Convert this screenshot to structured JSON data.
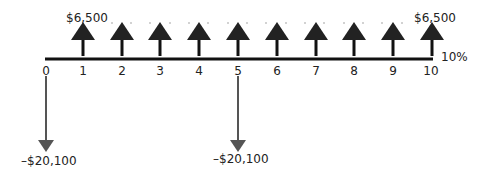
{
  "diagram": {
    "type": "cash-flow-timeline",
    "periods": [
      "0",
      "1",
      "2",
      "3",
      "4",
      "5",
      "6",
      "7",
      "8",
      "9",
      "10"
    ],
    "interest_rate_label": "10%",
    "inflows": {
      "label_first": "$6,500",
      "label_last": "$6,500",
      "periods": [
        1,
        2,
        3,
        4,
        5,
        6,
        7,
        8,
        9,
        10
      ],
      "amount": 6500
    },
    "outflows": [
      {
        "period": 0,
        "label": "–$20,100",
        "amount": -20100
      },
      {
        "period": 5,
        "label": "–$20,100",
        "amount": -20100
      }
    ]
  }
}
